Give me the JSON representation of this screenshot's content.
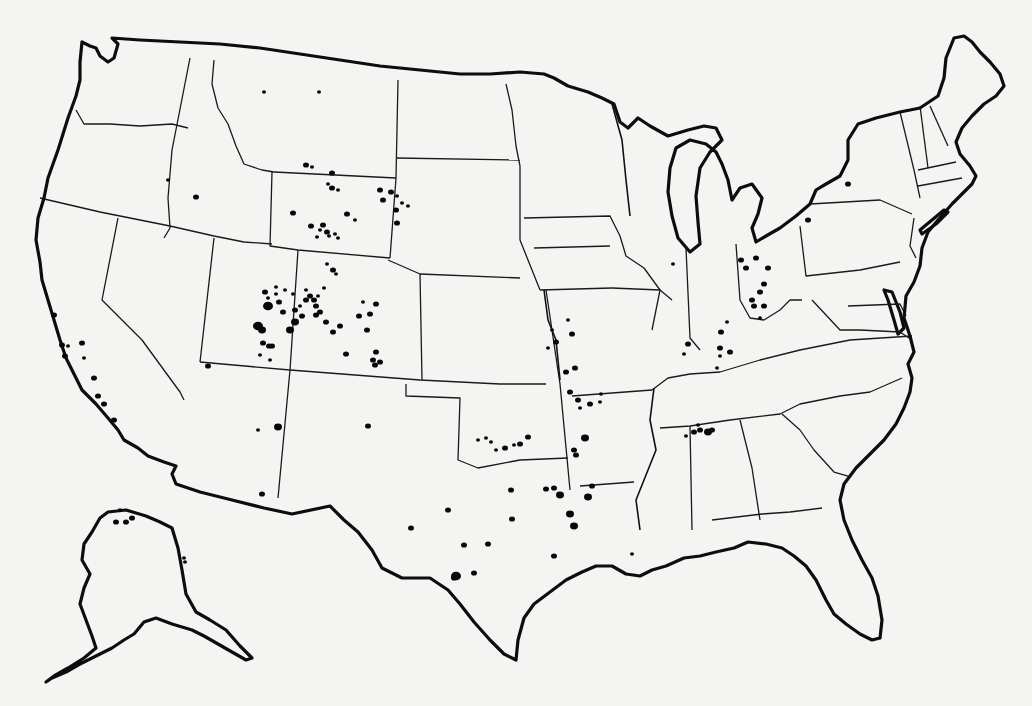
{
  "map": {
    "title": "",
    "description": "Outline map of the United States (with Alaska inset) showing state boundaries and black dot symbols marking locations",
    "colors": {
      "background": "#f4f4f3",
      "lines": "#0d0d0d",
      "dots": "#080808"
    },
    "coast_paths": [
      "M112,38 L118,44 L114,58 L108,62 L100,56 L96,48 L90,46 L82,42 L80,62 L80,80 L76,96 L68,118 L58,150 L48,178 L44,198 L38,218 L36,240 L40,262 L42,280 L48,300 L54,320 L60,340 L66,358 L74,374 L82,390 L96,404 L108,418 L118,430 L124,440 L138,448 L148,456 L164,462 L176,466 L172,474 L176,484 L200,492 L232,500 L264,508 L292,514 L330,506 L344,520 L358,532 L372,550 L382,568 L402,578 L430,578 L448,590 L460,604 L474,622 L490,640 L504,654 L516,660 L518,640 L524,618 L534,604 L550,592 L566,580 L582,572 L596,566 L612,566 L626,574 L640,576 L652,570 L666,566 L684,558 L700,556 L716,552 L734,548 L748,542 L766,544 L782,548 L794,556 L806,566 L816,580 L826,600 L834,614 L846,624 L860,634 L872,640 L880,638 L882,620 L878,596 L872,578 L862,560 L852,540 L844,520 L840,500 L844,484 L856,468 L870,454 L884,440 L896,424 L904,408 L910,392 L912,378 L908,364 L914,352 L910,336 L904,318 L906,296 L914,282 L920,266 L922,248 L928,232 L938,220 L952,204 L964,192 L972,184 L976,176 L970,166 L960,154 L956,142 L962,128 L972,116 L984,104 L996,96 L1004,86 L1000,74 L990,62 L980,52 L972,42 L964,36 L954,38 L946,58 L944,78 L938,96 L920,108 L900,112 L876,118 L858,124 L848,140 L848,160 L840,176 L826,184 L816,190 L810,204 L796,216 L780,228 L766,236 L756,242 L752,228 L758,214 L762,198 L752,184 L740,188 L732,200 L728,180 L722,164 L716,152 L706,144 L690,140 L676,148 L670,168 L668,192 L672,216 L678,238 L690,252 L700,244 L698,222 L696,196 L700,168 L710,152 L722,140 L716,128 L704,126 L688,130 L668,136 L650,126 L638,118 L628,128 L620,122 L614,104 L602,98 L588,92 L568,86 L554,78 L544,74 L520,72 L490,74 L460,74 L420,70 L380,66 L340,60 L300,54 L260,48 L220,44 L180,42 L140,40 Z"
    ],
    "alaska_path": "M100,518 L108,512 L126,510 L146,516 L160,522 L172,528 L178,548 L182,570 L186,594 L196,612 L210,620 L226,630 L240,646 L252,658 L246,660 L232,652 L218,644 L204,636 L192,630 L172,624 L156,618 L144,622 L134,634 L124,640 L112,648 L96,656 L80,664 L66,672 L52,678 L46,682 L54,676 L68,668 L84,658 L96,648 L92,636 L86,620 L80,604 L84,588 L90,574 L82,560 L84,544 L92,532 Z",
    "state_borders": [
      "M190,58 L172,150 L168,198 L170,228 L164,238",
      "M214,60 L212,84 L218,108 L228,124 L236,146 L244,164 L262,170 L274,172",
      "M76,110 L84,124 L110,124 L140,126 L172,124 L188,128",
      "M40,198 L100,212 L130,218 L170,226 L214,236 L244,242 L272,244",
      "M118,218 L102,300 L142,340 L180,392 L184,400",
      "M214,238 L200,362",
      "M272,172 L270,246 L298,250 L390,258",
      "M274,172 L396,178",
      "M398,80 L396,178 L390,258",
      "M506,84 L512,110 L516,146 L520,166",
      "M396,158 L520,160",
      "M388,260 L420,274 L520,278",
      "M520,166 L520,240 L540,290",
      "M298,250 L290,370 L278,498",
      "M200,362 L290,370 L420,380 L500,384 L546,384",
      "M420,274 L422,380",
      "M546,290 L560,384 L570,490",
      "M406,384 L406,396 L460,398 L458,460 L478,468 L520,460 L568,458",
      "M524,218 L610,216 L620,236 L626,256 L644,268 L660,290 L652,330",
      "M534,248 L610,246",
      "M540,290 L612,288",
      "M572,396 L652,390",
      "M580,486 L634,482",
      "M652,390 L668,378 L690,374 L720,372 L760,360 L800,350 L850,340 L912,336",
      "M660,428 L690,426 L730,420 L780,414 L800,404 L840,396 L870,392 L902,378",
      "M690,426 L692,530",
      "M740,420 L752,468 L760,520",
      "M712,520 L762,514 L790,512 L822,508",
      "M782,414 L800,430 L814,450 L834,472 L848,476",
      "M686,248 L690,338 L700,350",
      "M736,244 L740,300 L750,318 L764,320 L780,310 L790,300 L802,300",
      "M800,226 L806,276 L860,270 L900,262",
      "M810,204 L880,200 L912,214",
      "M900,112 L914,170 L920,198",
      "M920,106 L928,168",
      "M930,106 L948,146",
      "M918,170 L956,162",
      "M918,186 L962,178",
      "M914,218 L910,246 L916,258",
      "M848,306 L900,304 L906,316",
      "M812,300 L840,330 L860,330 L900,332 L912,340",
      "M612,288 L660,290 L672,300"
    ],
    "rivers": [
      "M612,104 L622,140 L626,180 L630,216",
      "M544,290 L548,320 L556,340 L560,380",
      "M654,388 L650,420 L656,450 L648,470 L636,500 L640,530"
    ],
    "inland_water": [
      "M884,290 L888,300 L894,320 L898,334 L904,328 L900,312 L892,292 Z",
      "M920,230 L932,220 L944,210 L948,212 L936,224 L922,234 Z"
    ],
    "dots": [
      [
        264,
        92,
        2
      ],
      [
        319,
        92,
        2
      ],
      [
        306,
        165,
        3
      ],
      [
        312,
        167,
        2
      ],
      [
        332,
        173,
        3
      ],
      [
        328,
        184,
        2
      ],
      [
        332,
        188,
        3
      ],
      [
        338,
        190,
        2
      ],
      [
        196,
        197,
        3
      ],
      [
        168,
        180,
        2
      ],
      [
        293,
        213,
        3
      ],
      [
        311,
        226,
        3
      ],
      [
        323,
        225,
        3
      ],
      [
        327,
        232,
        3
      ],
      [
        317,
        237,
        2
      ],
      [
        320,
        230,
        2
      ],
      [
        329,
        236,
        2
      ],
      [
        335,
        234,
        2
      ],
      [
        338,
        238,
        2
      ],
      [
        347,
        214,
        3
      ],
      [
        355,
        220,
        2
      ],
      [
        380,
        190,
        3
      ],
      [
        391,
        192,
        3
      ],
      [
        383,
        200,
        3
      ],
      [
        397,
        196,
        2
      ],
      [
        402,
        203,
        2
      ],
      [
        408,
        206,
        2
      ],
      [
        396,
        210,
        3
      ],
      [
        397,
        223,
        3
      ],
      [
        327,
        264,
        2
      ],
      [
        333,
        270,
        3
      ],
      [
        336,
        274,
        2
      ],
      [
        276,
        287,
        2
      ],
      [
        265,
        292,
        3
      ],
      [
        276,
        294,
        2
      ],
      [
        285,
        290,
        2
      ],
      [
        293,
        294,
        2
      ],
      [
        306,
        290,
        2
      ],
      [
        306,
        300,
        3
      ],
      [
        310,
        296,
        3
      ],
      [
        314,
        300,
        3
      ],
      [
        318,
        296,
        2
      ],
      [
        324,
        288,
        2
      ],
      [
        316,
        306,
        3
      ],
      [
        320,
        312,
        3
      ],
      [
        268,
        306,
        5
      ],
      [
        279,
        302,
        3
      ],
      [
        268,
        298,
        2
      ],
      [
        283,
        312,
        3
      ],
      [
        295,
        310,
        3
      ],
      [
        300,
        306,
        2
      ],
      [
        295,
        322,
        4
      ],
      [
        290,
        330,
        4
      ],
      [
        302,
        316,
        3
      ],
      [
        316,
        315,
        3
      ],
      [
        326,
        322,
        3
      ],
      [
        333,
        332,
        3
      ],
      [
        340,
        326,
        3
      ],
      [
        359,
        316,
        3
      ],
      [
        370,
        314,
        3
      ],
      [
        367,
        330,
        3
      ],
      [
        346,
        354,
        3
      ],
      [
        269,
        346,
        3
      ],
      [
        258,
        326,
        5
      ],
      [
        262,
        330,
        4
      ],
      [
        263,
        343,
        3
      ],
      [
        272,
        346,
        3
      ],
      [
        260,
        355,
        2
      ],
      [
        270,
        360,
        2
      ],
      [
        373,
        360,
        3
      ],
      [
        380,
        362,
        3
      ],
      [
        376,
        304,
        3
      ],
      [
        363,
        302,
        2
      ],
      [
        376,
        352,
        3
      ],
      [
        375,
        365,
        3
      ],
      [
        54,
        315,
        3
      ],
      [
        62,
        345,
        3
      ],
      [
        68,
        346,
        2
      ],
      [
        65,
        356,
        3
      ],
      [
        82,
        343,
        3
      ],
      [
        84,
        358,
        2
      ],
      [
        94,
        378,
        3
      ],
      [
        98,
        396,
        3
      ],
      [
        104,
        404,
        3
      ],
      [
        114,
        420,
        3
      ],
      [
        278,
        427,
        4
      ],
      [
        262,
        494,
        3
      ],
      [
        258,
        430,
        2
      ],
      [
        208,
        366,
        3
      ],
      [
        368,
        426,
        3
      ],
      [
        552,
        330,
        2
      ],
      [
        556,
        342,
        3
      ],
      [
        548,
        348,
        2
      ],
      [
        568,
        320,
        2
      ],
      [
        572,
        334,
        3
      ],
      [
        575,
        368,
        3
      ],
      [
        566,
        372,
        3
      ],
      [
        570,
        392,
        3
      ],
      [
        578,
        400,
        3
      ],
      [
        580,
        408,
        2
      ],
      [
        590,
        404,
        3
      ],
      [
        600,
        402,
        2
      ],
      [
        601,
        394,
        2
      ],
      [
        585,
        438,
        4
      ],
      [
        576,
        455,
        3
      ],
      [
        588,
        497,
        4
      ],
      [
        528,
        437,
        3
      ],
      [
        520,
        444,
        3
      ],
      [
        514,
        445,
        2
      ],
      [
        505,
        448,
        3
      ],
      [
        496,
        450,
        2
      ],
      [
        486,
        438,
        2
      ],
      [
        491,
        442,
        2
      ],
      [
        478,
        440,
        2
      ],
      [
        574,
        450,
        3
      ],
      [
        592,
        486,
        3
      ],
      [
        554,
        488,
        3
      ],
      [
        546,
        489,
        3
      ],
      [
        560,
        495,
        4
      ],
      [
        570,
        514,
        4
      ],
      [
        574,
        526,
        4
      ],
      [
        554,
        556,
        3
      ],
      [
        511,
        490,
        3
      ],
      [
        512,
        519,
        3
      ],
      [
        448,
        510,
        3
      ],
      [
        488,
        544,
        3
      ],
      [
        464,
        545,
        3
      ],
      [
        456,
        576,
        5
      ],
      [
        474,
        573,
        3
      ],
      [
        411,
        528,
        3
      ],
      [
        454,
        578,
        3
      ],
      [
        632,
        554,
        2
      ],
      [
        694,
        432,
        3
      ],
      [
        700,
        430,
        3
      ],
      [
        708,
        432,
        4
      ],
      [
        712,
        430,
        3
      ],
      [
        698,
        425,
        2
      ],
      [
        686,
        436,
        2
      ],
      [
        741,
        260,
        3
      ],
      [
        746,
        268,
        3
      ],
      [
        756,
        258,
        3
      ],
      [
        768,
        268,
        3
      ],
      [
        764,
        284,
        3
      ],
      [
        760,
        292,
        3
      ],
      [
        752,
        300,
        3
      ],
      [
        754,
        306,
        3
      ],
      [
        764,
        306,
        3
      ],
      [
        760,
        318,
        2
      ],
      [
        727,
        322,
        2
      ],
      [
        721,
        332,
        3
      ],
      [
        720,
        348,
        3
      ],
      [
        730,
        352,
        3
      ],
      [
        720,
        356,
        2
      ],
      [
        717,
        368,
        2
      ],
      [
        688,
        344,
        3
      ],
      [
        684,
        354,
        2
      ],
      [
        673,
        264,
        2
      ],
      [
        848,
        184,
        3
      ],
      [
        808,
        220,
        3
      ],
      [
        116,
        522,
        3
      ],
      [
        126,
        522,
        3
      ],
      [
        132,
        518,
        3
      ],
      [
        120,
        510,
        2
      ],
      [
        184,
        558,
        2
      ],
      [
        185,
        562,
        2
      ]
    ]
  }
}
